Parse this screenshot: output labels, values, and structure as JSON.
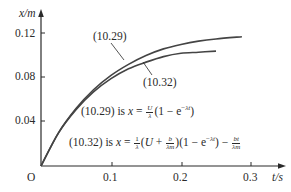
{
  "chart_data": {
    "type": "line",
    "title": "",
    "xlabel": "t/s",
    "ylabel": "x/m",
    "origin_label": "O",
    "xlim": [
      0,
      0.33
    ],
    "ylim": [
      0,
      0.135
    ],
    "x_ticks": [
      0.1,
      0.2,
      0.3
    ],
    "x_tick_labels": [
      "0.1",
      "0.2",
      "0.3"
    ],
    "y_ticks": [
      0.04,
      0.08,
      0.12
    ],
    "y_tick_labels": [
      "0.04",
      "0.08",
      "0.12"
    ],
    "grid": false,
    "series": [
      {
        "name": "(10.29)",
        "x": [
          0,
          0.025,
          0.05,
          0.075,
          0.1,
          0.125,
          0.15,
          0.175,
          0.2,
          0.225,
          0.25,
          0.287
        ],
        "values": [
          0,
          0.03,
          0.052,
          0.069,
          0.082,
          0.092,
          0.1,
          0.106,
          0.11,
          0.113,
          0.115,
          0.117
        ]
      },
      {
        "name": "(10.32)",
        "x": [
          0,
          0.025,
          0.05,
          0.075,
          0.1,
          0.125,
          0.15,
          0.175,
          0.2,
          0.225,
          0.25
        ],
        "values": [
          0,
          0.03,
          0.051,
          0.067,
          0.079,
          0.088,
          0.094,
          0.099,
          0.102,
          0.103,
          0.104
        ]
      }
    ],
    "annotations": [
      "(10.29) is x = U/λ (1 − e^(−λt))",
      "(10.32) is x = 1/λ (U + b/(λm))(1 − e^(−λt)) − bt/(λm)"
    ]
  },
  "labels": {
    "y_axis": "x/m",
    "x_axis": "t/s",
    "origin": "O",
    "y_ticks": [
      "0.12",
      "0.08",
      "0.04"
    ],
    "x_ticks": [
      "0.1",
      "0.2",
      "0.3"
    ],
    "curve_a": "(10.29)",
    "curve_b": "(10.32)",
    "eq1_prefix": "(10.29) is ",
    "eq2_prefix": "(10.32) is "
  }
}
